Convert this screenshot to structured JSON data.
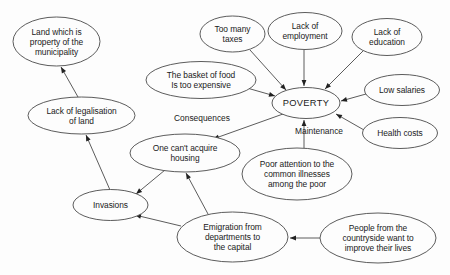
{
  "diagram": {
    "background_color": "#fdfdfd",
    "stroke_color": "#4a4a4a",
    "text_color": "#1a1a1a",
    "width": 450,
    "height": 275
  },
  "nodes": [
    {
      "id": "land-municipality",
      "label": "Land which is\nproperty of the\nmunicipality",
      "cx": 56.5,
      "cy": 41.5,
      "rx": 43.5,
      "ry": 24.5,
      "central": false
    },
    {
      "id": "lack-legalisation",
      "label": "Lack of legalisation\nof land",
      "cx": 81.5,
      "cy": 115.5,
      "rx": 53.5,
      "ry": 18.5,
      "central": false
    },
    {
      "id": "invasions",
      "label": "Invasions",
      "cx": 110.5,
      "cy": 205.0,
      "rx": 37.5,
      "ry": 15.5,
      "central": false
    },
    {
      "id": "basket-of-food",
      "label": "The basket of food\nIs too expensive",
      "cx": 201.0,
      "cy": 80.0,
      "rx": 55.0,
      "ry": 18.5,
      "central": false
    },
    {
      "id": "too-many-taxes",
      "label": "Too many\ntaxes",
      "cx": 232.5,
      "cy": 34.0,
      "rx": 32.5,
      "ry": 18.0,
      "central": false
    },
    {
      "id": "lack-employment",
      "label": "Lack of\nemployment",
      "cx": 305.0,
      "cy": 31.0,
      "rx": 37.0,
      "ry": 18.5,
      "central": false
    },
    {
      "id": "lack-education",
      "label": "Lack of\neducation",
      "cx": 387.0,
      "cy": 37.0,
      "rx": 35.0,
      "ry": 18.5,
      "central": false
    },
    {
      "id": "poverty",
      "label": "POVERTY",
      "cx": 306.0,
      "cy": 103.0,
      "rx": 34.0,
      "ry": 15.5,
      "central": true
    },
    {
      "id": "low-salaries",
      "label": "Low salaries",
      "cx": 402.0,
      "cy": 90.0,
      "rx": 37.5,
      "ry": 15.5,
      "central": false
    },
    {
      "id": "health-costs",
      "label": "Health costs",
      "cx": 400.0,
      "cy": 133.0,
      "rx": 37.5,
      "ry": 15.5,
      "central": false
    },
    {
      "id": "cant-acquire-housing",
      "label": "One can't acquire\nhousing",
      "cx": 185.0,
      "cy": 153.0,
      "rx": 55.0,
      "ry": 19.0,
      "central": false
    },
    {
      "id": "poor-attention-illnesses",
      "label": "Poor attention to the\ncommon illnesses\namong the poor",
      "cx": 297.0,
      "cy": 174.0,
      "rx": 55.0,
      "ry": 26.0,
      "central": false
    },
    {
      "id": "emigration-capital",
      "label": "Emigration from\ndepartments to\nthe capital",
      "cx": 232.5,
      "cy": 237.0,
      "rx": 55.5,
      "ry": 25.0,
      "central": false
    },
    {
      "id": "countryside-people",
      "label": "People from the\ncountryside want to\nimprove their lives",
      "cx": 378.0,
      "cy": 238.0,
      "rx": 58.0,
      "ry": 25.0,
      "central": false
    }
  ],
  "free_labels": [
    {
      "id": "consequences",
      "text": "Consequences",
      "x": 202.0,
      "y": 118.0
    },
    {
      "id": "maintenance",
      "text": "Maintenance",
      "x": 319.0,
      "y": 131.0
    }
  ],
  "edges": [
    {
      "id": "lack-legalisation-to-land",
      "from": "lack-legalisation",
      "to": "land-municipality",
      "x1": 78,
      "y1": 97,
      "x2": 61,
      "y2": 67,
      "arrow": "end"
    },
    {
      "id": "invasions-to-lack-legalisation",
      "from": "invasions",
      "to": "lack-legalisation",
      "x1": 110,
      "y1": 190,
      "x2": 86,
      "y2": 135,
      "arrow": "end"
    },
    {
      "id": "housing-to-invasions",
      "from": "cant-acquire-housing",
      "to": "invasions",
      "x1": 165,
      "y1": 170,
      "x2": 136,
      "y2": 194,
      "arrow": "end"
    },
    {
      "id": "emigration-to-invasions",
      "from": "emigration-capital",
      "to": "invasions",
      "x1": 181,
      "y1": 226,
      "x2": 135,
      "y2": 215,
      "arrow": "end"
    },
    {
      "id": "emigration-to-housing",
      "from": "emigration-capital",
      "to": "cant-acquire-housing",
      "x1": 208,
      "y1": 214,
      "x2": 186,
      "y2": 173,
      "arrow": "end"
    },
    {
      "id": "countryside-to-emigration",
      "from": "countryside-people",
      "to": "emigration-capital",
      "x1": 320,
      "y1": 238,
      "x2": 290,
      "y2": 238,
      "arrow": "end"
    },
    {
      "id": "poverty-to-housing",
      "from": "poverty",
      "to": "cant-acquire-housing",
      "x1": 283,
      "y1": 114,
      "x2": 213,
      "y2": 139,
      "arrow": "end"
    },
    {
      "id": "basket-to-poverty",
      "from": "basket-of-food",
      "to": "poverty",
      "x1": 247,
      "y1": 88,
      "x2": 275,
      "y2": 96,
      "arrow": "end"
    },
    {
      "id": "taxes-to-poverty",
      "from": "too-many-taxes",
      "to": "poverty",
      "x1": 250,
      "y1": 50,
      "x2": 286,
      "y2": 90,
      "arrow": "end"
    },
    {
      "id": "employment-to-poverty",
      "from": "lack-employment",
      "to": "poverty",
      "x1": 304,
      "y1": 50,
      "x2": 304,
      "y2": 86,
      "arrow": "end"
    },
    {
      "id": "education-to-poverty",
      "from": "lack-education",
      "to": "poverty",
      "x1": 363,
      "y1": 51,
      "x2": 325,
      "y2": 89,
      "arrow": "end"
    },
    {
      "id": "low-salaries-to-poverty",
      "from": "low-salaries",
      "to": "poverty",
      "x1": 366,
      "y1": 94,
      "x2": 341,
      "y2": 101,
      "arrow": "end"
    },
    {
      "id": "health-costs-to-poverty",
      "from": "health-costs",
      "to": "poverty",
      "x1": 364,
      "y1": 130,
      "x2": 336,
      "y2": 114,
      "arrow": "end"
    },
    {
      "id": "poor-attention-to-poverty",
      "from": "poor-attention-illnesses",
      "to": "poverty",
      "x1": 304,
      "y1": 148,
      "x2": 304,
      "y2": 120,
      "arrow": "end"
    }
  ]
}
